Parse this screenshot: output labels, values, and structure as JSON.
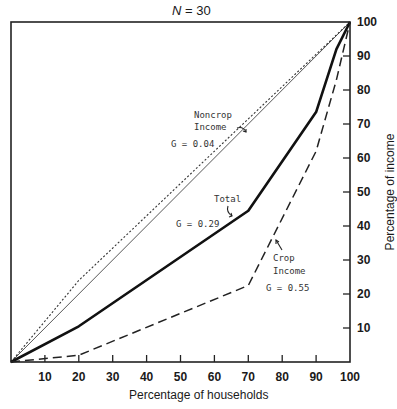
{
  "chart_data": {
    "type": "line",
    "title": "N = 30",
    "xlabel": "Percentage of households",
    "ylabel": "Percentage of income",
    "xlim": [
      0,
      100
    ],
    "ylim": [
      0,
      100
    ],
    "grid": false,
    "x_ticks": [
      10,
      20,
      30,
      40,
      50,
      60,
      70,
      80,
      90,
      100
    ],
    "y_ticks": [
      10,
      20,
      30,
      40,
      50,
      60,
      70,
      80,
      90,
      100
    ],
    "series": [
      {
        "name": "Equality line",
        "style": "thin solid",
        "x": [
          0,
          100
        ],
        "y": [
          0,
          100
        ]
      },
      {
        "name": "Noncrop Income",
        "gini": "G = 0.04",
        "style": "dotted",
        "x": [
          0,
          20,
          100
        ],
        "y": [
          0,
          24,
          100
        ]
      },
      {
        "name": "Total",
        "gini": "G = 0.29",
        "style": "thick solid",
        "x": [
          0,
          20,
          70,
          90,
          96,
          100
        ],
        "y": [
          0,
          10.5,
          44.5,
          73.5,
          92,
          100
        ]
      },
      {
        "name": "Crop Income",
        "gini": "G = 0.55",
        "style": "dashed",
        "x": [
          0,
          20,
          70,
          90,
          96,
          100
        ],
        "y": [
          0,
          2,
          22.5,
          62,
          83,
          100
        ]
      }
    ],
    "annotations": [
      {
        "text": "Noncrop Income",
        "x": 52,
        "y": 77
      },
      {
        "text": "G = 0.04",
        "x": 48,
        "y": 65
      },
      {
        "text": "Total",
        "x": 62,
        "y": 50
      },
      {
        "text": "G = 0.29",
        "x": 47,
        "y": 40
      },
      {
        "text": "Crop Income",
        "x": 75,
        "y": 30
      },
      {
        "text": "G = 0.55",
        "x": 75,
        "y": 20
      }
    ]
  },
  "labels": {
    "title_italic": "N",
    "title_rest": " = 30",
    "xlabel": "Percentage of households",
    "ylabel": "Percentage of income",
    "noncrop_line1": "Noncrop",
    "noncrop_line2": "Income",
    "noncrop_g": "G =  0.04",
    "total_label": "Total",
    "total_g": "G = 0.29",
    "crop_line1": "Crop",
    "crop_line2": "Income",
    "crop_g": "G = 0.55"
  },
  "x_tick_labels": [
    "10",
    "20",
    "30",
    "40",
    "50",
    "60",
    "70",
    "80",
    "90",
    "100"
  ],
  "y_tick_labels": [
    "10",
    "20",
    "30",
    "40",
    "50",
    "60",
    "70",
    "80",
    "90",
    "100"
  ]
}
